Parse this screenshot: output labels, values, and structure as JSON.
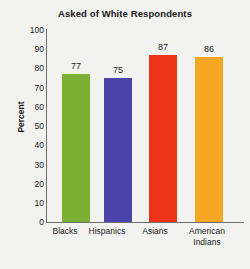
{
  "chart_data": {
    "type": "bar",
    "title": "Asked of White Respondents",
    "xlabel": "",
    "ylabel": "Percent",
    "ylim": [
      0,
      100
    ],
    "ytick_step": 10,
    "yticks": [
      100,
      90,
      80,
      70,
      60,
      50,
      40,
      30,
      20,
      10,
      0
    ],
    "grid": false,
    "legend": "none",
    "categories": [
      "Blacks",
      "Hispanics",
      "Asians",
      "American Indians"
    ],
    "values": [
      77,
      75,
      87,
      86
    ],
    "value_labels": [
      "77",
      "75",
      "87",
      "86"
    ],
    "colors": [
      "#7ab033",
      "#4a44a8",
      "#ed3419",
      "#f5a623"
    ],
    "bar_colors_named": [
      "green",
      "blue-purple",
      "red",
      "orange"
    ]
  },
  "chart": {
    "title": "Asked of White Respondents",
    "y_axis_label": "Percent",
    "y_tick_labels": [
      "100",
      "90",
      "80",
      "70",
      "60",
      "50",
      "40",
      "30",
      "20",
      "10",
      "0"
    ],
    "bars": [
      {
        "label": "Blacks",
        "value_label": "77",
        "label_line1": "Blacks",
        "label_line2": ""
      },
      {
        "label": "Hispanics",
        "value_label": "75",
        "label_line1": "Hispanics",
        "label_line2": ""
      },
      {
        "label": "Asians",
        "value_label": "87",
        "label_line1": "Asians",
        "label_line2": ""
      },
      {
        "label": "American Indians",
        "value_label": "86",
        "label_line1": "American",
        "label_line2": "Indians"
      }
    ]
  }
}
